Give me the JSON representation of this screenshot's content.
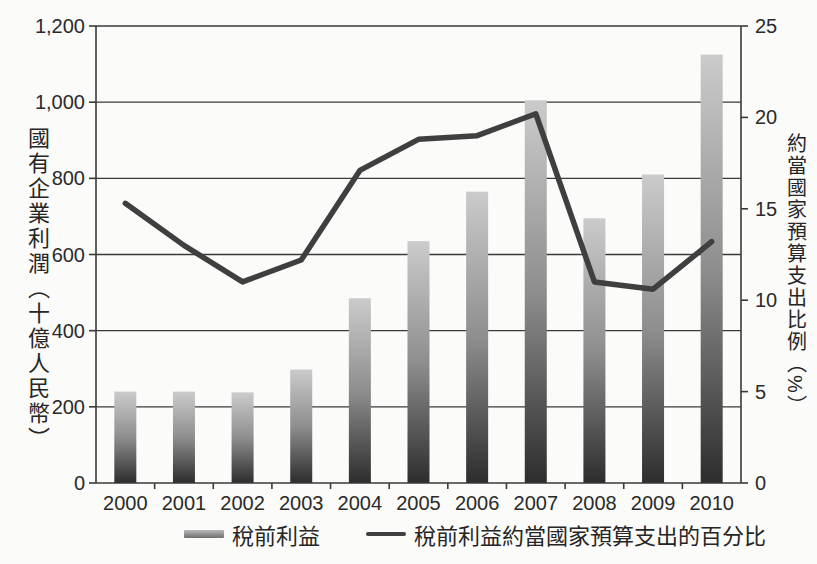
{
  "chart_data": {
    "type": "combo-bar-line",
    "categories": [
      "2000",
      "2001",
      "2002",
      "2003",
      "2004",
      "2005",
      "2006",
      "2007",
      "2008",
      "2009",
      "2010"
    ],
    "series": [
      {
        "name": "稅前利益",
        "type": "bar",
        "axis": "left",
        "values": [
          240,
          240,
          238,
          298,
          485,
          635,
          765,
          1005,
          695,
          810,
          1125
        ]
      },
      {
        "name": "稅前利益約當國家預算支出的百分比",
        "type": "line",
        "axis": "right",
        "values": [
          15.3,
          13.0,
          11.0,
          12.2,
          17.1,
          18.8,
          19.0,
          20.2,
          11.0,
          10.6,
          13.2
        ]
      }
    ],
    "left_axis": {
      "title": "國有企業利潤（十億人民幣）",
      "min": 0,
      "max": 1200,
      "tick_step": 200,
      "tick_labels": [
        "0",
        "200",
        "400",
        "600",
        "800",
        "1,000",
        "1,200"
      ]
    },
    "right_axis": {
      "title": "約當國家預算支出比例（%）",
      "min": 0,
      "max": 25,
      "tick_step": 5,
      "tick_labels": [
        "0",
        "5",
        "10",
        "15",
        "20",
        "25"
      ]
    },
    "grid": "horizontal gridlines at every left-axis tick (200); bars drawn over gridlines",
    "legend_position": "bottom-center",
    "xlabel": "",
    "title": ""
  },
  "legend": {
    "bar_label": "稅前利益",
    "line_label": "稅前利益約當國家預算支出的百分比"
  },
  "colors": {
    "background": "#fbfbf9",
    "axis_line": "#3a3a3a",
    "text": "#2a2a2a",
    "trend_line": "#3f3f3f",
    "bar_gradient_top": "#cbcbcb",
    "bar_gradient_mid": "#8e8e8e",
    "bar_gradient_bottom": "#2d2d2d"
  }
}
